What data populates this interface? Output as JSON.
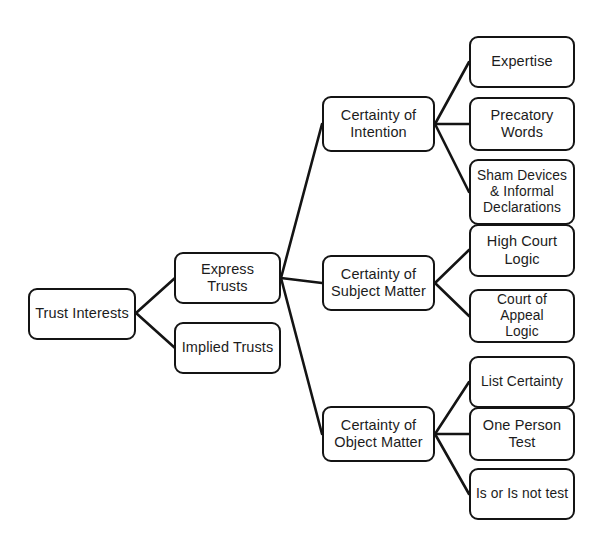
{
  "diagram": {
    "type": "tree-diagram",
    "background_color": "#ffffff",
    "node_border_color": "#141414",
    "node_fill_color": "#ffffff",
    "edge_color": "#141414"
  },
  "nodes": {
    "root": {
      "label": "Trust Interests"
    },
    "express": {
      "label": "Express Trusts"
    },
    "implied": {
      "label": "Implied Trusts"
    },
    "intention": {
      "label": "Certainty of\nIntention"
    },
    "subject": {
      "label": "Certainty of\nSubject Matter"
    },
    "object": {
      "label": "Certainty of\nObject Matter"
    },
    "expertise": {
      "label": "Expertise"
    },
    "precatory": {
      "label": "Precatory\nWords"
    },
    "sham": {
      "label": "Sham Devices\n& Informal\nDeclarations"
    },
    "high_court": {
      "label": "High Court\nLogic"
    },
    "court_appeal": {
      "label": "Court of Appeal\nLogic"
    },
    "list_certainty": {
      "label": "List Certainty"
    },
    "one_person": {
      "label": "One Person\nTest"
    },
    "is_or_not": {
      "label": "Is or Is not test"
    }
  }
}
